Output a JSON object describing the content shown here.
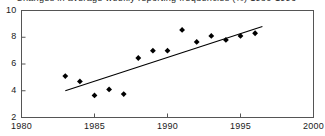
{
  "chart_data": {
    "type": "scatter",
    "title": "Changes in average weekly reporting frequencies (%) 1980-1996",
    "xlabel": "",
    "ylabel": "",
    "xlim": [
      1980,
      2000
    ],
    "ylim": [
      2,
      10
    ],
    "xticks": [
      1980,
      1985,
      1990,
      1995,
      2000
    ],
    "yticks": [
      2,
      4,
      6,
      8,
      10
    ],
    "xtick_labels": [
      "1980",
      "1985",
      "1990",
      "1995",
      "2000"
    ],
    "ytick_labels": [
      "2",
      "4",
      "6",
      "8",
      "10"
    ],
    "grid": false,
    "legend": false,
    "marker": "diamond",
    "marker_color": "#000000",
    "line_color": "#000000",
    "frame_color": "#555555",
    "x": [
      1983,
      1984,
      1985,
      1986,
      1987,
      1988,
      1989,
      1990,
      1991,
      1992,
      1993,
      1994,
      1995,
      1996
    ],
    "values": [
      5.1,
      4.7,
      3.65,
      4.1,
      3.75,
      6.45,
      7.0,
      7.0,
      8.55,
      7.65,
      8.1,
      7.8,
      8.1,
      8.3
    ],
    "series": [
      {
        "name": "Average weekly reporting frequency",
        "x": [
          1983,
          1984,
          1985,
          1986,
          1987,
          1988,
          1989,
          1990,
          1991,
          1992,
          1993,
          1994,
          1995,
          1996
        ],
        "values": [
          5.1,
          4.7,
          3.65,
          4.1,
          3.75,
          6.45,
          7.0,
          7.0,
          8.55,
          7.65,
          8.1,
          7.8,
          8.1,
          8.3
        ]
      }
    ],
    "trendline": {
      "name": "linear-fit",
      "x": [
        1983.0,
        1996.5
      ],
      "values": [
        4.0,
        8.8
      ]
    }
  }
}
